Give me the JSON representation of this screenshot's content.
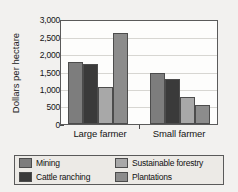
{
  "chart_data": {
    "type": "bar",
    "title": "",
    "subtitle": "",
    "xlabel": "",
    "ylabel": "Dollars per hectare",
    "categories": [
      "Large farmer",
      "Small farmer"
    ],
    "series": [
      {
        "name": "Mining",
        "color": "#7d7d7d",
        "values": [
          1800,
          1500
        ]
      },
      {
        "name": "Cattle ranching",
        "color": "#3a3a3a",
        "values": [
          1750,
          1320
        ]
      },
      {
        "name": "Sustainable forestry",
        "color": "#a8a8a8",
        "values": [
          1070,
          800
        ]
      },
      {
        "name": "Plantations",
        "color": "#8c8c8c",
        "values": [
          2650,
          550
        ]
      }
    ],
    "ylim": [
      0,
      3000
    ],
    "yticks": [
      0,
      500,
      1000,
      1500,
      2000,
      2500,
      3000
    ],
    "ytick_labels": [
      "0",
      "500",
      "1,000",
      "1,500",
      "2,000",
      "2,500",
      "3,000"
    ],
    "grid": true,
    "legend_position": "bottom"
  },
  "legend": {
    "items": [
      {
        "label": "Mining"
      },
      {
        "label": "Sustainable forestry"
      },
      {
        "label": "Cattle ranching"
      },
      {
        "label": "Plantations"
      }
    ]
  },
  "colors": {
    "background": "#f2f1ef",
    "plot_background": "#fdfdfc",
    "axis": "#5a5a5a",
    "gridline": "#d7d6d2",
    "legend_background": "#eceae6"
  }
}
